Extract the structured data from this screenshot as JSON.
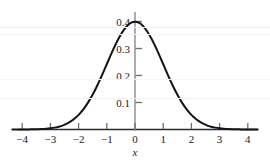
{
  "chart_data": {
    "type": "line",
    "title": "",
    "subtitle": "",
    "xlabel": "x",
    "ylabel": "",
    "xlim": [
      -4.35,
      4.35
    ],
    "ylim": [
      0,
      0.43
    ],
    "grid": false,
    "legend": null,
    "curve_name": "standard normal density",
    "formula": "f(x) = (1/sqrt(2*pi)) * exp(-x^2/2)",
    "x_ticks": [
      -4,
      -3,
      -2,
      -1,
      0,
      1,
      2,
      3,
      4
    ],
    "x_tick_labels": [
      "−4",
      "−3",
      "−2",
      "−1",
      "0",
      "1",
      "2",
      "3",
      "4"
    ],
    "y_ticks": [
      0.1,
      0.2,
      0.3,
      0.4
    ],
    "y_tick_labels": [
      "0.1",
      "0.2",
      "0.3",
      "0.4"
    ],
    "peak": {
      "x": 0,
      "y": 0.399
    },
    "x": [
      -4.35,
      -4.2,
      -4.05,
      -3.9,
      -3.75,
      -3.6,
      -3.45,
      -3.3,
      -3.15,
      -3.0,
      -2.85,
      -2.7,
      -2.55,
      -2.4,
      -2.25,
      -2.1,
      -1.95,
      -1.8,
      -1.65,
      -1.5,
      -1.35,
      -1.2,
      -1.05,
      -0.9,
      -0.75,
      -0.6,
      -0.45,
      -0.3,
      -0.15,
      0.0,
      0.15,
      0.3,
      0.45,
      0.6,
      0.75,
      0.9,
      1.05,
      1.2,
      1.35,
      1.5,
      1.65,
      1.8,
      1.95,
      2.1,
      2.25,
      2.4,
      2.55,
      2.7,
      2.85,
      3.0,
      3.15,
      3.3,
      3.45,
      3.6,
      3.75,
      3.9,
      4.05,
      4.2,
      4.35
    ],
    "y": [
      0.0001,
      0.0001,
      0.0001,
      0.0002,
      0.0004,
      0.0006,
      0.001,
      0.0017,
      0.0028,
      0.0044,
      0.0069,
      0.0104,
      0.0154,
      0.0224,
      0.0317,
      0.044,
      0.0596,
      0.079,
      0.1023,
      0.1295,
      0.1604,
      0.1942,
      0.2299,
      0.2661,
      0.3011,
      0.3332,
      0.3605,
      0.3814,
      0.3945,
      0.3989,
      0.3945,
      0.3814,
      0.3605,
      0.3332,
      0.3011,
      0.2661,
      0.2299,
      0.1942,
      0.1604,
      0.1295,
      0.1023,
      0.079,
      0.0596,
      0.044,
      0.0317,
      0.0224,
      0.0154,
      0.0104,
      0.0069,
      0.0044,
      0.0028,
      0.0017,
      0.001,
      0.0006,
      0.0004,
      0.0002,
      0.0001,
      0.0001,
      0.0001
    ]
  },
  "colors": {
    "curve": "#141414",
    "axis": "#7a7a7a",
    "x_axis": "#2b2b2b",
    "tick": "#6e6e6e",
    "label": "#1a1a1a",
    "background": "#ffffff"
  },
  "geometry": {
    "origin_x_px": 135,
    "baseline_y_px": 129.5,
    "px_per_x_unit": 28.2,
    "px_per_y_tenth": 27.0,
    "x_axis_left_px": 18,
    "x_axis_right_px": 258,
    "y_axis_top_px": 12
  }
}
